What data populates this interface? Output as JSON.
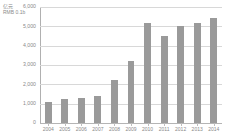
{
  "chart_data": {
    "type": "bar",
    "title": "",
    "subtitle": "",
    "xlabel": "",
    "ylabel": "亿元 RMB 0.1b",
    "ylabel_lines": [
      "亿元",
      "RMB 0.1b"
    ],
    "categories": [
      "2004",
      "2005",
      "2006",
      "2007",
      "2008",
      "2009",
      "2010",
      "2011",
      "2012",
      "2013",
      "2014"
    ],
    "values": [
      1100,
      1250,
      1270,
      1420,
      2200,
      3200,
      5150,
      4520,
      5030,
      5170,
      5430
    ],
    "ylim": [
      0,
      6000
    ],
    "ytick_values": [
      0,
      1000,
      2000,
      3000,
      4000,
      5000,
      6000
    ],
    "ytick_labels": [
      "0",
      "1,000",
      "2,000",
      "3,000",
      "4,000",
      "5,000",
      "6,000"
    ],
    "grid": true,
    "legend": false,
    "legend_position": "none",
    "series": [
      {
        "name": "",
        "values": [
          1100,
          1250,
          1270,
          1420,
          2200,
          3200,
          5150,
          4520,
          5030,
          5170,
          5430
        ],
        "color": "#9a9a9a"
      }
    ]
  },
  "colors": {
    "bar": "#9a9a9a",
    "gridline": "#d8d8d8",
    "axis": "#b0b0b0",
    "text": "#8a8a8a",
    "background": "#ffffff"
  }
}
